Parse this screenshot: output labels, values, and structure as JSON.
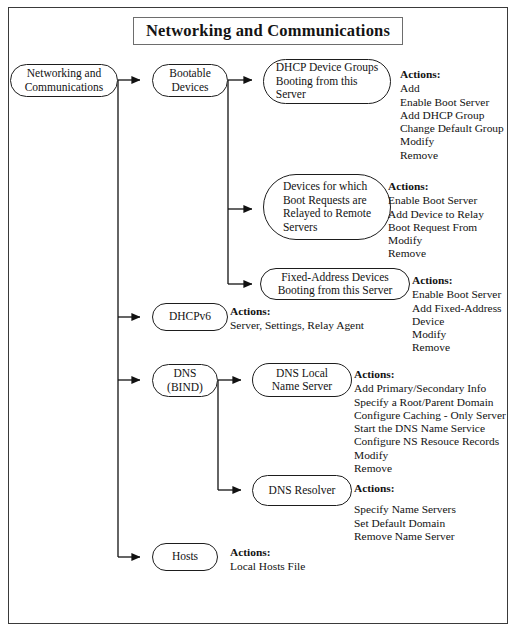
{
  "page": {
    "title": "Networking and Communications"
  },
  "diagram": {
    "type": "tree-flowchart",
    "root": {
      "label": "Networking and\nCommunications"
    },
    "nodes": [
      {
        "id": "root",
        "label": "Networking and\nCommunications"
      },
      {
        "id": "bootable",
        "label": "Bootable\nDevices"
      },
      {
        "id": "dhcp_groups",
        "label": "DHCP Device Groups\nBooting from this\nServer"
      },
      {
        "id": "relay_devices",
        "label": "Devices for which\nBoot Requests are\nRelayed to Remote\nServers"
      },
      {
        "id": "fixed_address",
        "label": "Fixed-Address Devices\nBooting from this Server"
      },
      {
        "id": "dhcpv6",
        "label": "DHCPv6"
      },
      {
        "id": "dns_bind",
        "label": "DNS\n(BIND)"
      },
      {
        "id": "dns_local",
        "label": "DNS Local\nName Server"
      },
      {
        "id": "dns_resolver",
        "label": "DNS Resolver"
      },
      {
        "id": "hosts",
        "label": "Hosts"
      }
    ],
    "actions_label": "Actions:",
    "action_groups": [
      {
        "id": "dhcp_groups_actions",
        "for": "dhcp_groups",
        "heading": "Actions:",
        "items": "Add\nEnable Boot Server\nAdd DHCP Group\nChange Default Group\nModify\nRemove"
      },
      {
        "id": "relay_devices_actions",
        "for": "relay_devices",
        "heading": "Actions:",
        "items": "Enable Boot Server\nAdd Device to Relay\n   Boot Request From\nModify\nRemove"
      },
      {
        "id": "fixed_address_actions",
        "for": "fixed_address",
        "heading": "Actions:",
        "items": "Enable Boot Server\nAdd Fixed-Address\n   Device\nModify\nRemove"
      },
      {
        "id": "dhcpv6_actions",
        "for": "dhcpv6",
        "heading": "Actions:",
        "items": "Server, Settings, Relay Agent"
      },
      {
        "id": "dns_local_actions",
        "for": "dns_local",
        "heading": "Actions:",
        "items": "Add Primary/Secondary Info\nSpecify a Root/Parent Domain\nConfigure Caching - Only Server\nStart the DNS Name Service\nConfigure NS Resouce Records\nModify\nRemove"
      },
      {
        "id": "dns_resolver_actions",
        "for": "dns_resolver",
        "heading": "Actions:",
        "items": "Specify Name Servers\nSet Default Domain\nRemove Name Server"
      },
      {
        "id": "hosts_actions",
        "for": "hosts",
        "heading": "Actions:",
        "items": "Local Hosts File"
      }
    ],
    "edges": [
      {
        "from": "root",
        "to": "bootable"
      },
      {
        "from": "root",
        "to": "dhcpv6"
      },
      {
        "from": "root",
        "to": "dns_bind"
      },
      {
        "from": "root",
        "to": "hosts"
      },
      {
        "from": "bootable",
        "to": "dhcp_groups"
      },
      {
        "from": "bootable",
        "to": "relay_devices"
      },
      {
        "from": "bootable",
        "to": "fixed_address"
      },
      {
        "from": "dns_bind",
        "to": "dns_local"
      },
      {
        "from": "dns_bind",
        "to": "dns_resolver"
      }
    ]
  },
  "colors": {
    "ink": "#121212",
    "border": "#1d1d1d",
    "page_border": "#3a3a3a",
    "background": "#ffffff"
  }
}
